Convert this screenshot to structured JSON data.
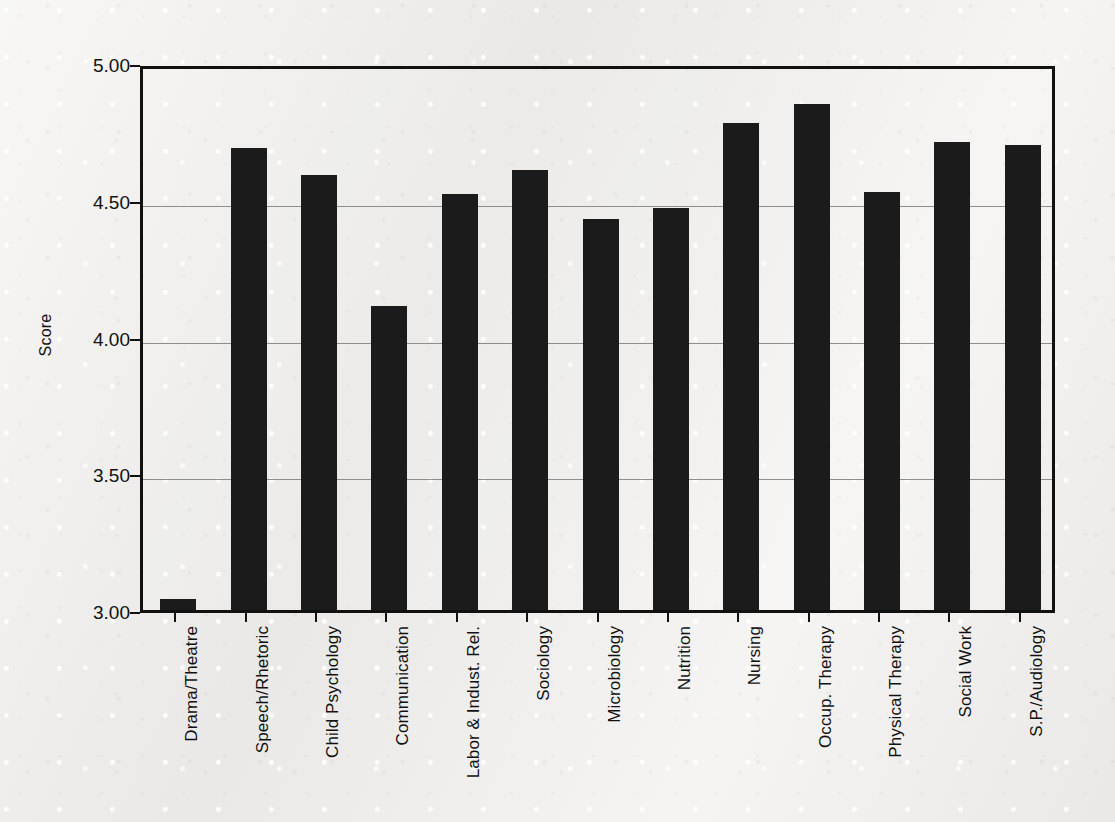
{
  "chart_data": {
    "type": "bar",
    "title": "",
    "subtitle": "",
    "xlabel": "",
    "ylabel": "Score",
    "ylim": [
      3.0,
      5.0
    ],
    "yticks": [
      "3.00",
      "3.50",
      "4.00",
      "4.50",
      "5.00"
    ],
    "ytick_values": [
      3.0,
      3.5,
      4.0,
      4.5,
      5.0
    ],
    "grid": "horizontal",
    "legend": "none",
    "bar_color": "#1b1b1b",
    "categories": [
      "Drama/Theatre",
      "Speech/Rhetoric",
      "Child Psychology",
      "Communication",
      "Labor & Indust. Rel.",
      "Sociology",
      "Microbiology",
      "Nutrition",
      "Nursing",
      "Occup. Therapy",
      "Physical Therapy",
      "Social Work",
      "S.P./Audiology"
    ],
    "values": [
      3.04,
      4.69,
      4.59,
      4.11,
      4.52,
      4.61,
      4.43,
      4.47,
      4.78,
      4.85,
      4.53,
      4.71,
      4.7
    ]
  }
}
